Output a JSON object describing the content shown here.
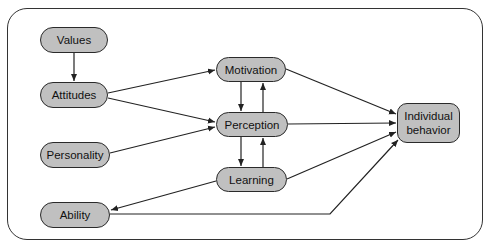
{
  "diagram": {
    "type": "flow",
    "colors": {
      "node_fill": "#c0c0c0",
      "node_border": "#2a2a2a",
      "edge": "#222222",
      "frame": "#333333"
    },
    "nodes": {
      "values": {
        "label": "Values"
      },
      "attitudes": {
        "label": "Attitudes"
      },
      "personality": {
        "label": "Personality"
      },
      "ability": {
        "label": "Ability"
      },
      "motivation": {
        "label": "Motivation"
      },
      "perception": {
        "label": "Perception"
      },
      "learning": {
        "label": "Learning"
      },
      "individual_behavior": {
        "label": "Individual behavior",
        "line1": "Individual",
        "line2": "behavior"
      }
    },
    "edges": [
      {
        "from": "Values",
        "to": "Attitudes"
      },
      {
        "from": "Attitudes",
        "to": "Motivation"
      },
      {
        "from": "Attitudes",
        "to": "Perception"
      },
      {
        "from": "Personality",
        "to": "Perception"
      },
      {
        "from": "Motivation",
        "to": "Perception"
      },
      {
        "from": "Perception",
        "to": "Motivation"
      },
      {
        "from": "Perception",
        "to": "Learning"
      },
      {
        "from": "Learning",
        "to": "Perception"
      },
      {
        "from": "Learning",
        "to": "Ability"
      },
      {
        "from": "Motivation",
        "to": "Individual behavior"
      },
      {
        "from": "Perception",
        "to": "Individual behavior"
      },
      {
        "from": "Learning",
        "to": "Individual behavior"
      },
      {
        "from": "Ability",
        "to": "Individual behavior"
      }
    ]
  }
}
